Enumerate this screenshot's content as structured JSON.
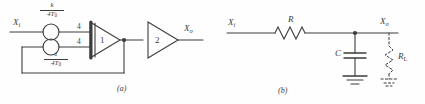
{
  "figure": {
    "background_color": "#fefefe",
    "line_color": "#3c3c3c",
    "panels": [
      {
        "caption": "(a)",
        "title": "analog-block-diagram",
        "input_label": "X",
        "input_sub": "i",
        "output_label": "X",
        "output_sub": "o",
        "gain_top": {
          "numerator": "k",
          "denominator": "4T",
          "den_sub": "0"
        },
        "gain_bottom": {
          "numerator": "1",
          "denominator": "4T",
          "den_sub": "0"
        },
        "summer_input_top": "4",
        "summer_input_bottom": "4",
        "amp1_gain": "1",
        "amp2_gain": "2"
      },
      {
        "caption": "(b)",
        "title": "rc-lowpass-network",
        "input_label": "X",
        "input_sub": "i",
        "output_label": "X",
        "output_sub": "o",
        "resistor_label": "R",
        "capacitor_label": "C",
        "load_label": "R",
        "load_sub": "L"
      }
    ]
  }
}
